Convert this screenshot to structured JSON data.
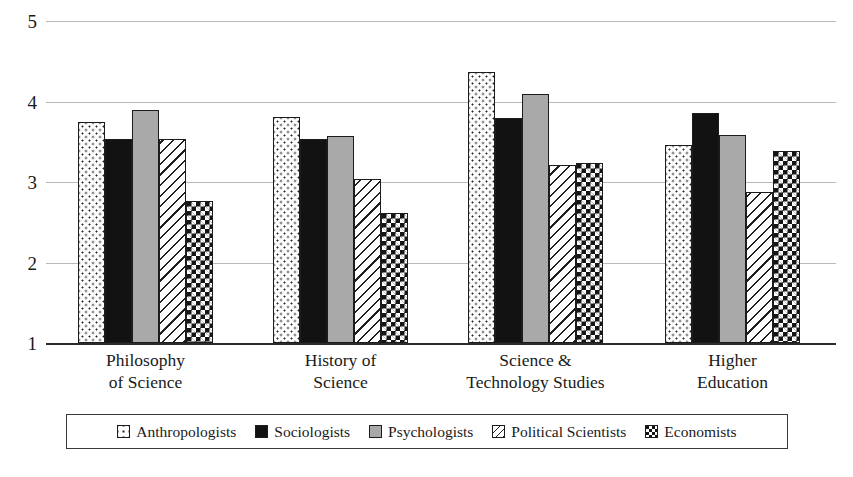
{
  "chart_data": {
    "type": "bar",
    "title": "",
    "subtitle": "",
    "xlabel": "",
    "ylabel": "",
    "ylim": [
      1,
      5
    ],
    "yticks": [
      "1",
      "2",
      "3",
      "4",
      "5"
    ],
    "grid": true,
    "legend_position": "bottom",
    "categories": [
      "Philosophy of Science",
      "History of Science",
      "Science & Technology Studies",
      "Higher Education"
    ],
    "category_lines": [
      [
        "Philosophy",
        "of Science"
      ],
      [
        "History of",
        "Science"
      ],
      [
        "Science &",
        "Technology Studies"
      ],
      [
        "Higher",
        "Education"
      ]
    ],
    "series": [
      {
        "name": "Anthropologists",
        "pattern": "dotted",
        "values": [
          3.74,
          3.81,
          4.37,
          3.46
        ]
      },
      {
        "name": "Sociologists",
        "pattern": "solid-black",
        "values": [
          3.53,
          3.53,
          3.79,
          3.86
        ]
      },
      {
        "name": "Psychologists",
        "pattern": "gray",
        "values": [
          3.9,
          3.57,
          4.09,
          3.59
        ]
      },
      {
        "name": "Political Scientists",
        "pattern": "diagonal-hatch",
        "values": [
          3.54,
          3.04,
          3.21,
          2.87
        ]
      },
      {
        "name": "Economists",
        "pattern": "checkerboard",
        "values": [
          2.76,
          2.62,
          3.24,
          3.38
        ]
      }
    ]
  },
  "colors": {
    "dotted": "#fdfdfd",
    "solid_black": "#121212",
    "gray": "#a9a9a9",
    "hatch": "#ffffff",
    "checkerboard": "#151515",
    "gridline": "#b9b9b9",
    "axis": "#2b2b2b",
    "text": "#1a1a1a"
  }
}
